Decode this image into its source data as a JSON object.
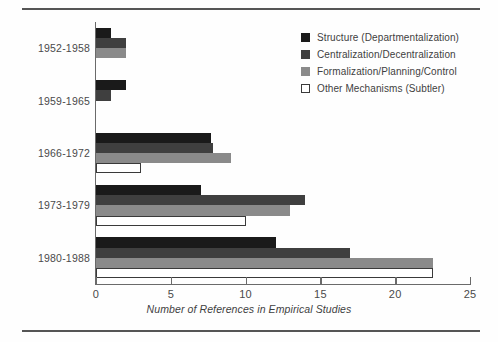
{
  "chart_data": {
    "type": "bar",
    "orientation": "horizontal",
    "title": "",
    "xlabel": "Number of References in Empirical Studies",
    "ylabel": "",
    "xlim": [
      0,
      25
    ],
    "xticks": [
      0,
      5,
      10,
      15,
      20,
      25
    ],
    "xtick_labels": [
      "0",
      "5",
      "10",
      "15",
      "20",
      "25"
    ],
    "grid": false,
    "legend_position": "top-right",
    "categories": [
      "1952-1958",
      "1959-1965",
      "1966-1972",
      "1973-1979",
      "1980-1988"
    ],
    "series": [
      {
        "name": "Structure (Departmentalization)",
        "color": "#1a1a1a",
        "values": [
          1,
          2,
          7.7,
          7,
          12
        ]
      },
      {
        "name": "Centralization/Decentralization",
        "color": "#3f3f3f",
        "values": [
          2,
          1,
          7.8,
          14,
          17
        ]
      },
      {
        "name": "Formalization/Planning/Control",
        "color": "#8a8a8a",
        "values": [
          2,
          0,
          9,
          13,
          22.5
        ]
      },
      {
        "name": "Other Mechanisms (Subtler)",
        "color": "#ffffff",
        "values": [
          0,
          0,
          3,
          10,
          22.5
        ]
      }
    ]
  },
  "legend": {
    "items": [
      {
        "label": "Structure (Departmentalization)",
        "swatch": "black-square-icon"
      },
      {
        "label": "Centralization/Decentralization",
        "swatch": "dark-gray-square-icon"
      },
      {
        "label": "Formalization/Planning/Control",
        "swatch": "gray-square-icon"
      },
      {
        "label": "Other Mechanisms (Subtler)",
        "swatch": "white-square-icon"
      }
    ]
  }
}
